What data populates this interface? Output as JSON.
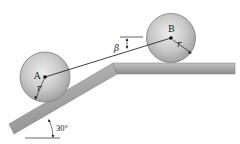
{
  "diagram": {
    "wheel_a": {
      "label": "A",
      "radius_label": "r"
    },
    "wheel_b": {
      "label": "B",
      "radius_label": "r"
    },
    "cord_angle": {
      "label": "β"
    },
    "incline": {
      "angle_label": "30°"
    },
    "colors": {
      "wheel_fill": "#c8c8c8",
      "wheel_edge": "#7a7a7a",
      "surface_fill": "#a9a9a9",
      "surface_edge": "#6f6f6f",
      "line": "#222222"
    }
  }
}
